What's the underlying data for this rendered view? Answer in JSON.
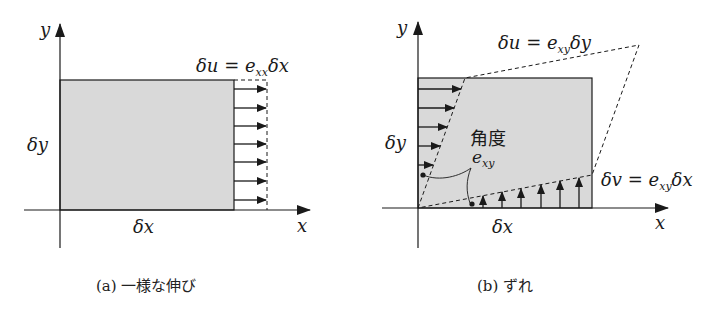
{
  "figure_a": {
    "axis_x_label": "x",
    "axis_y_label": "y",
    "width_label": "δx",
    "height_label": "δy",
    "displacement_label": "δu = e",
    "displacement_sub": "xx",
    "displacement_tail": "δx",
    "caption": "(a) 一様な伸び"
  },
  "figure_b": {
    "axis_x_label": "x",
    "axis_y_label": "y",
    "width_label": "δx",
    "height_label": "δy",
    "top_label": "δu = e",
    "top_sub": "xy",
    "top_tail": "δy",
    "right_label": "δv = e",
    "right_sub": "xy",
    "right_tail": "δx",
    "angle_label": "角度",
    "angle_symbol": "e",
    "angle_sub": "xy",
    "caption": "(b) ずれ"
  },
  "colors": {
    "fill": "#d9d9d9",
    "stroke": "#1a1a1a"
  }
}
